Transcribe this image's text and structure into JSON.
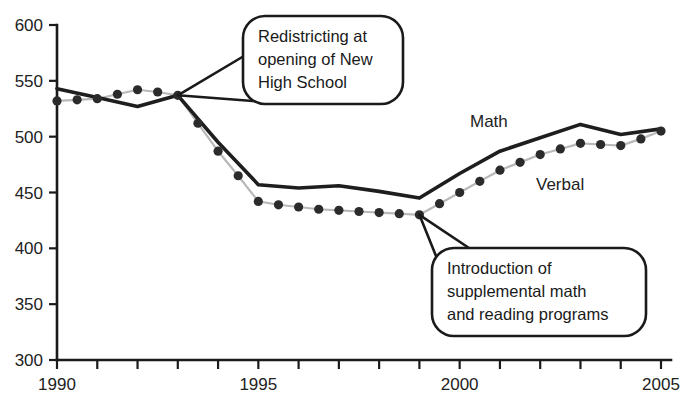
{
  "chart_data": {
    "type": "line",
    "title": "",
    "xlabel": "",
    "ylabel": "",
    "xlim": [
      1990,
      2005
    ],
    "ylim": [
      300,
      600
    ],
    "grid": false,
    "legend_position": "inline-labels",
    "x_ticks": [
      1990,
      1991,
      1992,
      1993,
      1994,
      1995,
      1996,
      1997,
      1998,
      1999,
      2000,
      2001,
      2002,
      2003,
      2004,
      2005
    ],
    "x_tick_labels": [
      "1990",
      "",
      "",
      "",
      "",
      "1995",
      "",
      "",
      "",
      "",
      "2000",
      "",
      "",
      "",
      "",
      "2005"
    ],
    "y_ticks": [
      300,
      350,
      400,
      450,
      500,
      550,
      600
    ],
    "y_tick_labels": [
      "300",
      "350",
      "400",
      "450",
      "500",
      "550",
      "600"
    ],
    "x": [
      1990,
      1991,
      1992,
      1993,
      1994,
      1995,
      1996,
      1997,
      1998,
      1999,
      2000,
      2001,
      2002,
      2003,
      2004,
      2005
    ],
    "series": [
      {
        "name": "Math",
        "label": "Math",
        "marker": "none",
        "color": "#1e1e1e",
        "values": [
          543,
          535,
          527,
          537,
          495,
          457,
          454,
          456,
          451,
          445,
          467,
          487,
          499,
          511,
          502,
          507
        ]
      },
      {
        "name": "Verbal",
        "label": "Verbal",
        "marker": "circle",
        "color": "#2b2b2b",
        "values": [
          532,
          534,
          542,
          537,
          487,
          442,
          437,
          434,
          432,
          430,
          450,
          470,
          484,
          494,
          492,
          505
        ]
      }
    ],
    "verbal_half_year_x": [
      1990,
      1990.5,
      1991,
      1991.5,
      1992,
      1992.5,
      1993,
      1993.5,
      1994,
      1994.5,
      1995,
      1995.5,
      1996,
      1996.5,
      1997,
      1997.5,
      1998,
      1998.5,
      1999,
      1999.5,
      2000,
      2000.5,
      2001,
      2001.5,
      2002,
      2002.5,
      2003,
      2003.5,
      2004,
      2004.5,
      2005
    ],
    "verbal_half_year_values": [
      532,
      533,
      534,
      538,
      542,
      540,
      537,
      512,
      487,
      465,
      442,
      439,
      437,
      435,
      434,
      433,
      432,
      431,
      430,
      440,
      450,
      460,
      470,
      477,
      484,
      489,
      494,
      493,
      492,
      498,
      505
    ],
    "annotations": [
      {
        "id": "redistricting",
        "text_lines": [
          "Redistricting at",
          "opening of New",
          "High School"
        ],
        "target_x": 1993,
        "target_y": 537
      },
      {
        "id": "supplemental-programs",
        "text_lines": [
          "Introduction of",
          "supplemental math",
          "and reading programs"
        ],
        "target_x": 1999,
        "target_y": 430
      }
    ]
  }
}
